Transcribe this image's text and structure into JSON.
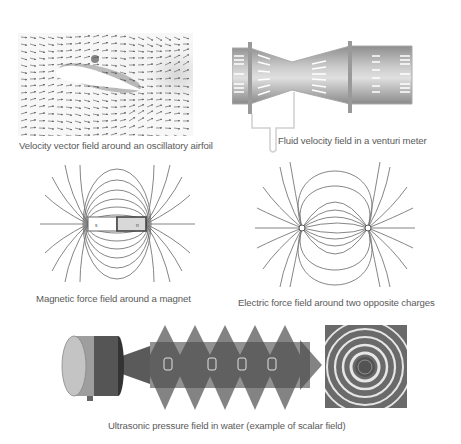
{
  "figures": {
    "airfoil": {
      "caption": "Velocity vector field around an oscillatory airfoil",
      "icon": "airfoil-vector-field"
    },
    "venturi": {
      "caption": "Fluid velocity field in a venturi meter",
      "icon": "venturi-meter"
    },
    "magnet": {
      "caption": "Magnetic force field around a magnet",
      "pole_left": "s",
      "pole_right": "n",
      "icon": "bar-magnet-field"
    },
    "charges": {
      "caption": "Electric force field around two opposite charges",
      "charge_left": "+",
      "charge_right": "−",
      "icon": "dipole-field"
    },
    "ultrasonic": {
      "caption": "Ultrasonic pressure field in water (example of scalar field)",
      "icon": "ultrasonic-pressure-field"
    }
  },
  "colors": {
    "caption_text": "#5a5a5a",
    "line_gray": "#777777",
    "background": "#ffffff"
  }
}
